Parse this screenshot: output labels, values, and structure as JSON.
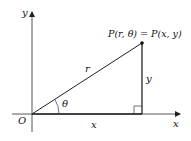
{
  "diagram": {
    "axes": {
      "x_label": "x",
      "y_label": "y",
      "origin_label": "O"
    },
    "point_label": "P(r, θ) = P(x, y)",
    "segments": {
      "hypotenuse_label": "r",
      "vertical_label": "y",
      "horizontal_label": "x"
    },
    "angle_label": "θ",
    "colors": {
      "line": "#222222",
      "background": "#ffffff"
    }
  }
}
